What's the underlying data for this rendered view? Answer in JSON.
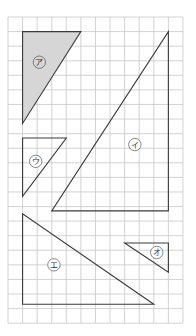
{
  "figure": {
    "grid": {
      "origin_x": 8,
      "origin_y": 17,
      "cell": 14.58,
      "cols": 12,
      "rows": 21,
      "line_color": "#c8c8c8",
      "border_color": "#bdbdbd"
    },
    "stroke_color": "#3a3a3a",
    "shade_color": "#d6d6d6",
    "triangles": [
      {
        "id": "a",
        "label": "ア",
        "points": [
          [
            1,
            1
          ],
          [
            5,
            1
          ],
          [
            1,
            7.3
          ]
        ],
        "shaded": true,
        "label_pos": [
          2.15,
          3.1
        ]
      },
      {
        "id": "i",
        "label": "イ",
        "points": [
          [
            11,
            1
          ],
          [
            11,
            13.3
          ],
          [
            3,
            13.3
          ]
        ],
        "shaded": false,
        "label_pos": [
          8.7,
          8.75
        ]
      },
      {
        "id": "u",
        "label": "ウ",
        "points": [
          [
            1,
            8.3
          ],
          [
            4,
            8.3
          ],
          [
            1,
            12.3
          ]
        ],
        "shaded": false,
        "label_pos": [
          1.9,
          9.9
        ]
      },
      {
        "id": "e",
        "label": "エ",
        "points": [
          [
            1,
            13.5
          ],
          [
            1,
            19.7
          ],
          [
            10,
            19.7
          ]
        ],
        "shaded": false,
        "label_pos": [
          3.15,
          17.0
        ]
      },
      {
        "id": "o",
        "label": "オ",
        "points": [
          [
            8,
            15.5
          ],
          [
            11,
            15.5
          ],
          [
            11,
            17.5
          ]
        ],
        "shaded": false,
        "label_pos": [
          10.2,
          16.15
        ]
      }
    ]
  }
}
